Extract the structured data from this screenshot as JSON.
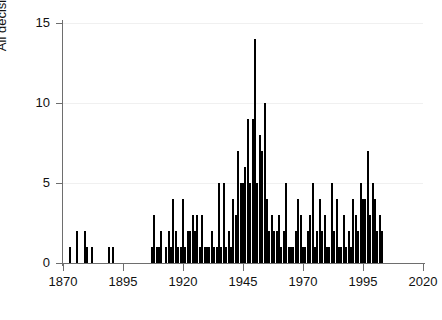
{
  "chart_data": {
    "type": "bar",
    "title": "",
    "subtitle": "",
    "xlabel": "",
    "ylabel": "All decisions",
    "xlim": [
      1870,
      2020
    ],
    "ylim": [
      0,
      15
    ],
    "xticks": [
      1870,
      1895,
      1920,
      1945,
      1970,
      1995,
      2020
    ],
    "yticks": [
      0,
      5,
      10,
      15
    ],
    "grid": "horizontal-faint",
    "legend": "none",
    "bar_color": "#000000",
    "background_color": "#ffffff",
    "axis_color": "#6e6e6e",
    "gridline_color": "#f0f0f0",
    "x": [
      1873,
      1876,
      1879,
      1880,
      1882,
      1889,
      1891,
      1893,
      1894,
      1896,
      1907,
      1908,
      1909,
      1910,
      1911,
      1912,
      1913,
      1914,
      1915,
      1916,
      1917,
      1918,
      1919,
      1920,
      1921,
      1922,
      1923,
      1924,
      1925,
      1926,
      1927,
      1928,
      1929,
      1930,
      1931,
      1932,
      1933,
      1934,
      1935,
      1936,
      1937,
      1938,
      1939,
      1940,
      1941,
      1942,
      1943,
      1944,
      1945,
      1946,
      1947,
      1948,
      1949,
      1950,
      1951,
      1952,
      1953,
      1954,
      1955,
      1956,
      1957,
      1958,
      1959,
      1960,
      1961,
      1962,
      1963,
      1964,
      1965,
      1966,
      1967,
      1968,
      1969,
      1970,
      1971,
      1972,
      1973,
      1974,
      1975,
      1976,
      1977,
      1978,
      1979,
      1980,
      1981,
      1982,
      1983,
      1984,
      1985,
      1986,
      1987,
      1988,
      1989,
      1990,
      1991,
      1992,
      1993,
      1994,
      1995,
      1996,
      1997,
      1998,
      1999,
      2000,
      2001,
      2002,
      2003
    ],
    "values": [
      1,
      2,
      2,
      1,
      1,
      1,
      1,
      0,
      0,
      0,
      1,
      3,
      1,
      1,
      2,
      0,
      1,
      2,
      1,
      4,
      2,
      1,
      1,
      4,
      1,
      2,
      2,
      3,
      2,
      3,
      1,
      3,
      1,
      1,
      1,
      2,
      1,
      1,
      5,
      1,
      5,
      1,
      2,
      1,
      4,
      3,
      7,
      5,
      5,
      6,
      9,
      5,
      9,
      14,
      5,
      8,
      7,
      10,
      4,
      2,
      3,
      2,
      2,
      3,
      1,
      2,
      5,
      1,
      1,
      1,
      2,
      4,
      3,
      1,
      1,
      2,
      3,
      5,
      1,
      2,
      4,
      2,
      3,
      1,
      1,
      5,
      2,
      4,
      1,
      1,
      3,
      1,
      2,
      1,
      4,
      3,
      2,
      5,
      4,
      4,
      7,
      3,
      5,
      4,
      2,
      3,
      2
    ]
  }
}
